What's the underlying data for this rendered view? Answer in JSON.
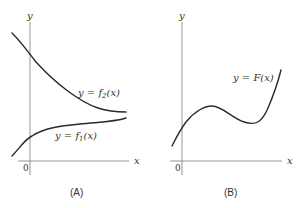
{
  "panels": [
    {
      "id": "A",
      "caption": "(A)",
      "axes": {
        "x_label": "x",
        "y_label": "y",
        "origin_label": "0"
      },
      "curves": [
        {
          "name": "f2",
          "label": "y = f₂(x)",
          "description": "decreasing, concave up, approaching asymptote from above"
        },
        {
          "name": "f1",
          "label": "y = f₁(x)",
          "description": "increasing, concave down, approaching asymptote from below"
        }
      ]
    },
    {
      "id": "B",
      "caption": "(B)",
      "axes": {
        "x_label": "x",
        "y_label": "y",
        "origin_label": "0"
      },
      "curves": [
        {
          "name": "F",
          "label": "y = F(x)",
          "description": "cubic-like: rises to local max, dips to local min, then rises steeply"
        }
      ]
    }
  ],
  "colors": {
    "curve": "#2a2a2a",
    "axis": "#8a8a8a",
    "text": "#333333",
    "background": "#ffffff"
  }
}
